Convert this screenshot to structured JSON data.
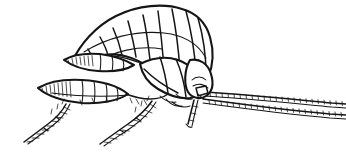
{
  "figure": {
    "medium": "black ink line drawing on white background",
    "caption": "",
    "background_color": "#ffffff",
    "ink_color": "#151515",
    "canvas": {
      "width": 346,
      "height": 154
    },
    "orientation": "head at right, telson and uropods at left",
    "parts": [
      {
        "name": "pleon-dorsal-body",
        "label": "Abdomen (pleon) — arched, segmented dorsal body",
        "segment_count": 9,
        "region": {
          "x": 60,
          "y": 6,
          "width": 150,
          "height": 80
        }
      },
      {
        "name": "upper-uropod",
        "label": "Upper uropod / pleopod ramus, segmented and pointed",
        "region": {
          "x": 62,
          "y": 50,
          "width": 70,
          "height": 18
        }
      },
      {
        "name": "lower-uropod",
        "label": "Lower uropod / pleopod ramus, segmented and pointed",
        "region": {
          "x": 38,
          "y": 78,
          "width": 80,
          "height": 22
        }
      },
      {
        "name": "pereon-thorax",
        "label": "Thorax (pereon) with coxal plates",
        "region": {
          "x": 130,
          "y": 40,
          "width": 80,
          "height": 60
        }
      },
      {
        "name": "head-capsule",
        "label": "Head with antennal bases",
        "region": {
          "x": 185,
          "y": 45,
          "width": 35,
          "height": 50
        }
      },
      {
        "name": "antenna-1",
        "label": "First antenna — long, segmented, reaching right image edge",
        "region": {
          "x": 198,
          "y": 88,
          "width": 148,
          "height": 14
        }
      },
      {
        "name": "antenna-2",
        "label": "Second antenna — long, segmented, reaching right image edge",
        "region": {
          "x": 198,
          "y": 96,
          "width": 148,
          "height": 18
        }
      },
      {
        "name": "leg-rear",
        "label": "Rear pereopod with setae, directed down-left",
        "region": {
          "x": 18,
          "y": 98,
          "width": 80,
          "height": 48
        }
      },
      {
        "name": "leg-middle",
        "label": "Middle pereopod with setae, directed down-left",
        "region": {
          "x": 100,
          "y": 95,
          "width": 80,
          "height": 50
        }
      },
      {
        "name": "leg-front",
        "label": "Front pereopod / gnathopod, short and directed down",
        "region": {
          "x": 178,
          "y": 95,
          "width": 45,
          "height": 35
        }
      }
    ],
    "line_styles": {
      "outline": "thick",
      "segment_divisions": "medium",
      "setae_and_hatching": "hairline"
    }
  }
}
